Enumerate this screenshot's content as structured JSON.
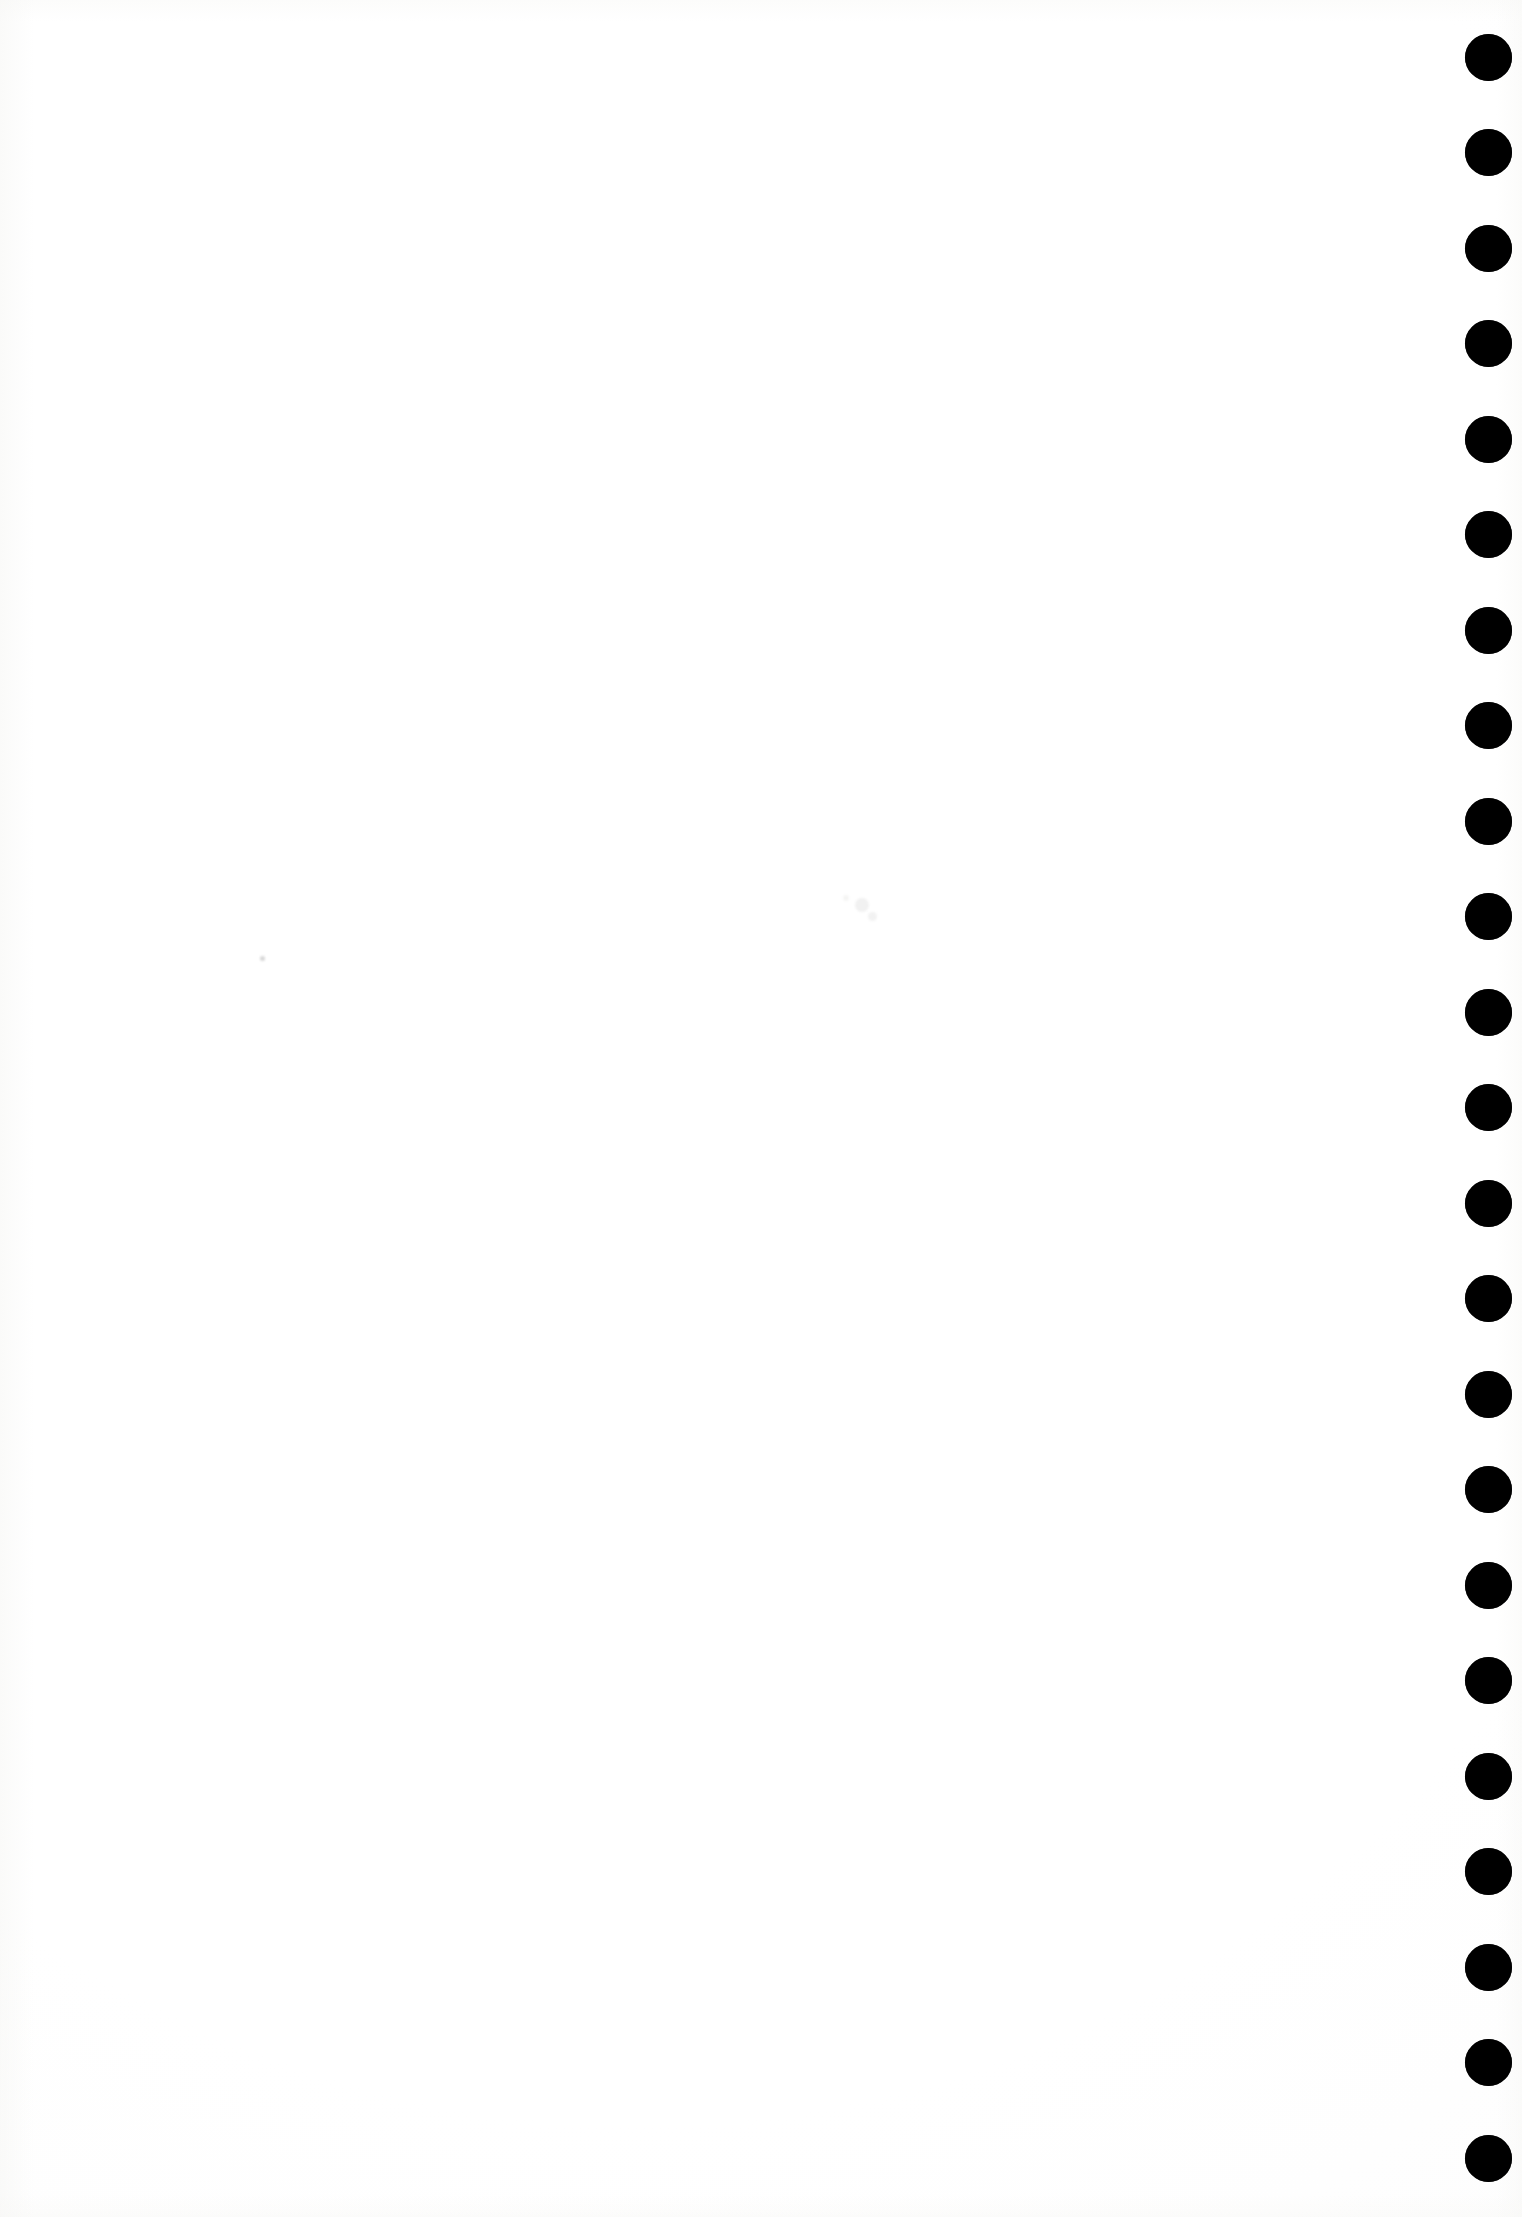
{
  "page": {
    "width": 1522,
    "height": 2217,
    "background_color": "#ffffff",
    "content_text": ""
  },
  "dot_column": {
    "name": "edge-registration-dot-column",
    "color": "#000000",
    "count": 23,
    "diameter": 47,
    "center_x": 1488,
    "first_center_y": 57,
    "spacing_y": 95.5,
    "dots": [
      {
        "index": 1,
        "cx": 1488,
        "cy": 57,
        "d": 47
      },
      {
        "index": 2,
        "cx": 1488,
        "cy": 152,
        "d": 47
      },
      {
        "index": 3,
        "cx": 1488,
        "cy": 248,
        "d": 47
      },
      {
        "index": 4,
        "cx": 1488,
        "cy": 343,
        "d": 47
      },
      {
        "index": 5,
        "cx": 1488,
        "cy": 439,
        "d": 47
      },
      {
        "index": 6,
        "cx": 1488,
        "cy": 534,
        "d": 47
      },
      {
        "index": 7,
        "cx": 1488,
        "cy": 630,
        "d": 47
      },
      {
        "index": 8,
        "cx": 1488,
        "cy": 725,
        "d": 47
      },
      {
        "index": 9,
        "cx": 1488,
        "cy": 821,
        "d": 47
      },
      {
        "index": 10,
        "cx": 1488,
        "cy": 916,
        "d": 47
      },
      {
        "index": 11,
        "cx": 1488,
        "cy": 1012,
        "d": 47
      },
      {
        "index": 12,
        "cx": 1488,
        "cy": 1107,
        "d": 47
      },
      {
        "index": 13,
        "cx": 1488,
        "cy": 1203,
        "d": 47
      },
      {
        "index": 14,
        "cx": 1488,
        "cy": 1298,
        "d": 47
      },
      {
        "index": 15,
        "cx": 1488,
        "cy": 1394,
        "d": 47
      },
      {
        "index": 16,
        "cx": 1488,
        "cy": 1489,
        "d": 47
      },
      {
        "index": 17,
        "cx": 1488,
        "cy": 1585,
        "d": 47
      },
      {
        "index": 18,
        "cx": 1488,
        "cy": 1680,
        "d": 47
      },
      {
        "index": 19,
        "cx": 1488,
        "cy": 1776,
        "d": 47
      },
      {
        "index": 20,
        "cx": 1488,
        "cy": 1871,
        "d": 47
      },
      {
        "index": 21,
        "cx": 1488,
        "cy": 1967,
        "d": 47
      },
      {
        "index": 22,
        "cx": 1488,
        "cy": 2062,
        "d": 47
      },
      {
        "index": 23,
        "cx": 1488,
        "cy": 2158,
        "d": 47
      }
    ]
  },
  "scan_artifacts": {
    "name": "scanner-specks",
    "specks": [
      {
        "cx": 262,
        "cy": 958,
        "d": 5,
        "color": "rgba(150,150,150,0.38)"
      },
      {
        "cx": 862,
        "cy": 905,
        "d": 14,
        "color": "rgba(210,210,208,0.30)"
      },
      {
        "cx": 872,
        "cy": 916,
        "d": 9,
        "color": "rgba(205,205,203,0.26)"
      },
      {
        "cx": 846,
        "cy": 898,
        "d": 6,
        "color": "rgba(212,212,210,0.24)"
      }
    ]
  }
}
